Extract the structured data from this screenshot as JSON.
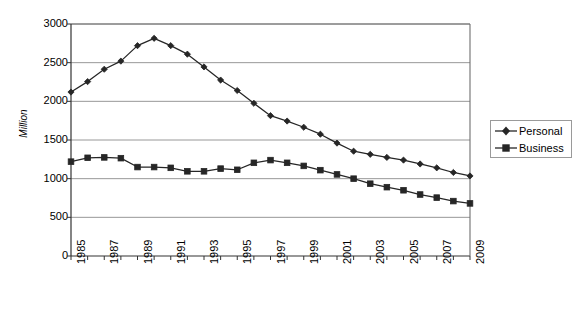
{
  "chart_data": {
    "type": "line",
    "title": "",
    "subtitle": "",
    "xlabel": "",
    "ylabel": "Million",
    "ylim": [
      0,
      3000
    ],
    "ytick_values": [
      0,
      500,
      1000,
      1500,
      2000,
      2500,
      3000
    ],
    "ytick_labels": [
      "0",
      "500",
      "1000",
      "1500",
      "2000",
      "2500",
      "3000"
    ],
    "grid": true,
    "grid_axis": "y",
    "legend_position": "right",
    "legend_entries": [
      "Personal",
      "Business"
    ],
    "x": [
      1985,
      1986,
      1987,
      1988,
      1989,
      1990,
      1991,
      1992,
      1993,
      1994,
      1995,
      1996,
      1997,
      1998,
      1999,
      2000,
      2001,
      2002,
      2003,
      2004,
      2005,
      2006,
      2007,
      2008,
      2009
    ],
    "xtick_labels": [
      "1985",
      "1987",
      "1989",
      "1991",
      "1993",
      "1995",
      "1997",
      "1999",
      "2001",
      "2003",
      "2005",
      "2007",
      "2009"
    ],
    "xtick_values": [
      1985,
      1987,
      1989,
      1991,
      1993,
      1995,
      1997,
      1999,
      2001,
      2003,
      2005,
      2007,
      2009
    ],
    "series": [
      {
        "name": "Personal",
        "marker": "diamond",
        "color": "#262626",
        "values": [
          2120,
          2255,
          2415,
          2520,
          2720,
          2815,
          2720,
          2610,
          2445,
          2275,
          2140,
          1975,
          1815,
          1745,
          1665,
          1575,
          1460,
          1355,
          1315,
          1275,
          1240,
          1190,
          1140,
          1080,
          1035
        ]
      },
      {
        "name": "Business",
        "marker": "square",
        "color": "#262626",
        "values": [
          1220,
          1270,
          1275,
          1265,
          1150,
          1150,
          1140,
          1095,
          1095,
          1130,
          1115,
          1205,
          1240,
          1205,
          1165,
          1110,
          1055,
          1000,
          935,
          890,
          850,
          795,
          755,
          710,
          680
        ]
      }
    ],
    "colors": {
      "plot_border": "#6e6e6e",
      "gridline": "#8c8c8c",
      "axis_line": "#333333",
      "background": "#ffffff",
      "legend_border": "#9a9a9a"
    },
    "plot_area": {
      "left": 71,
      "top": 24,
      "right": 470,
      "bottom": 256
    }
  }
}
